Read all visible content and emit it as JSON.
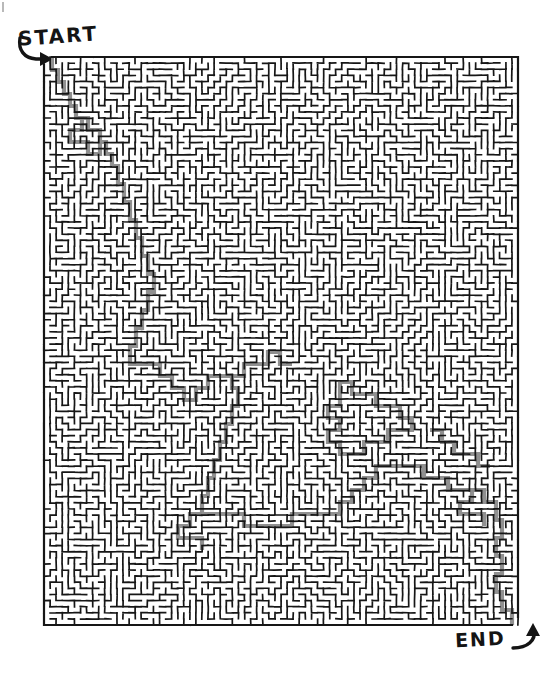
{
  "page": {
    "background_color": "#ffffff",
    "width": 549,
    "height": 675
  },
  "labels": {
    "start": "START",
    "end": "END"
  },
  "icons": {
    "start_arrow": "curved-arrow-right-icon",
    "end_arrow": "curved-arrow-right-icon"
  },
  "maze": {
    "x": 44,
    "y": 57,
    "width": 474,
    "height": 568,
    "columns": 78,
    "rows": 93,
    "cell_size": 6.1,
    "wall_color": "#161616",
    "wall_thickness": 1.7,
    "background_color": "#ffffff",
    "solution_color": "#8a8a8a",
    "solution_thickness": 4.2,
    "entrance": {
      "side": "top-left",
      "x": 52,
      "y": 57
    },
    "exit": {
      "side": "bottom-right",
      "x": 512,
      "y": 625
    },
    "seed": 20240517
  },
  "solution_path": {
    "description": "Gray shaded corridor from the top-left entrance down the left-centre, looping through the middle, drifting right across the lower half and out of the bottom-right exit.",
    "points": [
      [
        52,
        57
      ],
      [
        52,
        70
      ],
      [
        58,
        70
      ],
      [
        58,
        82
      ],
      [
        64,
        82
      ],
      [
        64,
        94
      ],
      [
        70,
        94
      ],
      [
        70,
        106
      ],
      [
        76,
        106
      ],
      [
        76,
        118
      ],
      [
        88,
        118
      ],
      [
        88,
        130
      ],
      [
        100,
        130
      ],
      [
        100,
        142
      ],
      [
        106,
        142
      ],
      [
        106,
        154
      ],
      [
        112,
        154
      ],
      [
        112,
        166
      ],
      [
        118,
        166
      ],
      [
        118,
        184
      ],
      [
        124,
        184
      ],
      [
        124,
        202
      ],
      [
        130,
        202
      ],
      [
        130,
        220
      ],
      [
        136,
        220
      ],
      [
        136,
        238
      ],
      [
        142,
        238
      ],
      [
        142,
        256
      ],
      [
        148,
        256
      ],
      [
        148,
        274
      ],
      [
        154,
        274
      ],
      [
        154,
        292
      ],
      [
        148,
        292
      ],
      [
        148,
        310
      ],
      [
        142,
        310
      ],
      [
        142,
        328
      ],
      [
        136,
        328
      ],
      [
        136,
        346
      ],
      [
        130,
        346
      ],
      [
        130,
        364
      ],
      [
        136,
        364
      ],
      [
        148,
        364
      ],
      [
        160,
        364
      ],
      [
        160,
        376
      ],
      [
        172,
        376
      ],
      [
        172,
        388
      ],
      [
        184,
        388
      ],
      [
        184,
        400
      ],
      [
        196,
        400
      ],
      [
        196,
        388
      ],
      [
        208,
        388
      ],
      [
        208,
        376
      ],
      [
        220,
        376
      ],
      [
        232,
        376
      ],
      [
        232,
        388
      ],
      [
        238,
        388
      ],
      [
        238,
        406
      ],
      [
        232,
        406
      ],
      [
        232,
        424
      ],
      [
        226,
        424
      ],
      [
        226,
        442
      ],
      [
        220,
        442
      ],
      [
        220,
        460
      ],
      [
        214,
        460
      ],
      [
        214,
        478
      ],
      [
        208,
        478
      ],
      [
        208,
        496
      ],
      [
        202,
        496
      ],
      [
        202,
        514
      ],
      [
        208,
        514
      ],
      [
        220,
        514
      ],
      [
        232,
        514
      ],
      [
        244,
        514
      ],
      [
        244,
        526
      ],
      [
        256,
        526
      ],
      [
        268,
        526
      ],
      [
        280,
        526
      ],
      [
        292,
        526
      ],
      [
        292,
        514
      ],
      [
        304,
        514
      ],
      [
        316,
        514
      ],
      [
        328,
        514
      ],
      [
        340,
        514
      ],
      [
        340,
        502
      ],
      [
        352,
        502
      ],
      [
        352,
        490
      ],
      [
        364,
        490
      ],
      [
        364,
        478
      ],
      [
        376,
        478
      ],
      [
        376,
        466
      ],
      [
        388,
        466
      ],
      [
        400,
        466
      ],
      [
        412,
        466
      ],
      [
        424,
        466
      ],
      [
        424,
        478
      ],
      [
        436,
        478
      ],
      [
        448,
        478
      ],
      [
        448,
        490
      ],
      [
        460,
        490
      ],
      [
        472,
        490
      ],
      [
        484,
        490
      ],
      [
        484,
        502
      ],
      [
        496,
        502
      ],
      [
        496,
        520
      ],
      [
        502,
        520
      ],
      [
        502,
        538
      ],
      [
        496,
        538
      ],
      [
        496,
        556
      ],
      [
        502,
        556
      ],
      [
        502,
        574
      ],
      [
        496,
        574
      ],
      [
        496,
        592
      ],
      [
        502,
        592
      ],
      [
        502,
        610
      ],
      [
        508,
        610
      ],
      [
        512,
        610
      ],
      [
        512,
        625
      ]
    ],
    "branches": [
      {
        "name": "upper-left-loop",
        "points": [
          [
            76,
            118
          ],
          [
            82,
            118
          ],
          [
            82,
            130
          ],
          [
            76,
            130
          ],
          [
            70,
            130
          ],
          [
            70,
            142
          ],
          [
            76,
            142
          ],
          [
            88,
            142
          ],
          [
            88,
            154
          ],
          [
            100,
            154
          ],
          [
            100,
            142
          ]
        ]
      },
      {
        "name": "centre-spur",
        "points": [
          [
            232,
            376
          ],
          [
            244,
            376
          ],
          [
            244,
            364
          ],
          [
            256,
            364
          ],
          [
            268,
            364
          ],
          [
            268,
            352
          ],
          [
            280,
            352
          ],
          [
            280,
            364
          ],
          [
            292,
            364
          ]
        ]
      },
      {
        "name": "right-upper-branch",
        "points": [
          [
            340,
            382
          ],
          [
            352,
            382
          ],
          [
            352,
            394
          ],
          [
            364,
            394
          ],
          [
            376,
            394
          ],
          [
            376,
            406
          ],
          [
            388,
            406
          ],
          [
            400,
            406
          ],
          [
            400,
            418
          ],
          [
            412,
            418
          ],
          [
            412,
            430
          ],
          [
            400,
            430
          ],
          [
            388,
            430
          ],
          [
            388,
            442
          ],
          [
            376,
            442
          ],
          [
            364,
            442
          ],
          [
            364,
            454
          ],
          [
            352,
            454
          ],
          [
            340,
            454
          ],
          [
            340,
            442
          ],
          [
            328,
            442
          ],
          [
            328,
            430
          ],
          [
            340,
            430
          ],
          [
            340,
            418
          ],
          [
            328,
            418
          ],
          [
            328,
            406
          ],
          [
            340,
            406
          ],
          [
            340,
            394
          ],
          [
            340,
            382
          ]
        ]
      },
      {
        "name": "lower-left-spur",
        "points": [
          [
            202,
            514
          ],
          [
            190,
            514
          ],
          [
            190,
            526
          ],
          [
            178,
            526
          ],
          [
            178,
            538
          ],
          [
            190,
            538
          ],
          [
            202,
            538
          ],
          [
            202,
            550
          ]
        ]
      },
      {
        "name": "right-edge-spur",
        "points": [
          [
            472,
            490
          ],
          [
            472,
            502
          ],
          [
            460,
            502
          ],
          [
            460,
            514
          ],
          [
            472,
            514
          ],
          [
            484,
            514
          ],
          [
            484,
            526
          ]
        ]
      },
      {
        "name": "top-right-nub",
        "points": [
          [
            430,
            430
          ],
          [
            442,
            430
          ],
          [
            442,
            442
          ],
          [
            454,
            442
          ],
          [
            454,
            454
          ],
          [
            466,
            454
          ],
          [
            478,
            454
          ],
          [
            478,
            466
          ],
          [
            490,
            466
          ]
        ]
      }
    ]
  },
  "speck": {
    "x": 2,
    "y": 2,
    "width": 2,
    "height": 10
  }
}
